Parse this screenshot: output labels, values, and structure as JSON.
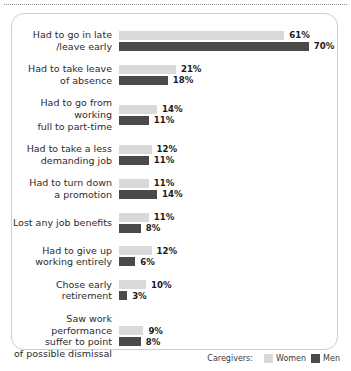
{
  "chart_data": {
    "type": "bar",
    "orientation": "horizontal",
    "title": "",
    "xlabel": "",
    "ylabel": "",
    "grid": false,
    "xlim": [
      0,
      70
    ],
    "value_suffix": "%",
    "legend_position": "bottom-right",
    "legend_title": "Caregivers:",
    "categories": [
      "Had to go in late\n/leave early",
      "Had to take leave\nof absence",
      "Had to go from working\nfull to part-time",
      "Had to take a less\ndemanding job",
      "Had to turn down\na promotion",
      "Lost any job benefits",
      "Had to give up\nworking entirely",
      "Chose early retirement",
      "Saw work performance\nsuffer to point\nof possible dismissal"
    ],
    "series": [
      {
        "name": "Women",
        "color": "#d9d9d9",
        "values": [
          61,
          21,
          14,
          12,
          11,
          11,
          12,
          10,
          9
        ],
        "labels": [
          "61%",
          "21%",
          "14%",
          "12%",
          "11%",
          "11%",
          "12%",
          "10%",
          "9%"
        ]
      },
      {
        "name": "Men",
        "color": "#4a4a4a",
        "values": [
          70,
          18,
          11,
          11,
          14,
          8,
          6,
          3,
          8
        ],
        "labels": [
          "70%",
          "18%",
          "11%",
          "11%",
          "14%",
          "8%",
          "6%",
          "3%",
          "8%"
        ]
      }
    ]
  },
  "legend": {
    "title": "Caregivers:",
    "items": [
      {
        "label": "Women",
        "color": "#d9d9d9"
      },
      {
        "label": "Men",
        "color": "#4a4a4a"
      }
    ]
  }
}
